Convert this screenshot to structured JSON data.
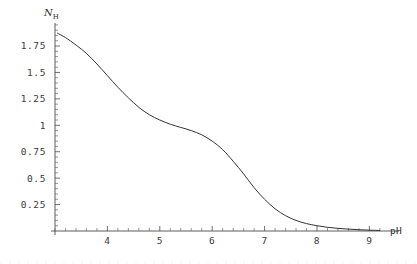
{
  "figure": {
    "kind": "mathematica-plot",
    "background_color": "#ffffff",
    "curve_color": "#333333",
    "axis_color": "#4a4a4a"
  },
  "labels": {
    "y_axis_symbol": "N",
    "y_axis_subscript": "H",
    "x_axis_title": "pH"
  },
  "chart_data": {
    "type": "line",
    "title": "",
    "subtitle": "",
    "xlabel": "pH",
    "ylabel": "N_H",
    "grid": false,
    "legend": null,
    "xlim": [
      3.0,
      9.3
    ],
    "ylim": [
      0.0,
      1.95
    ],
    "x_ticks_major": [
      4,
      5,
      6,
      7,
      8,
      9
    ],
    "x_tick_labels": [
      "4",
      "5",
      "6",
      "7",
      "8",
      "9"
    ],
    "x_minor_per_interval": 4,
    "y_ticks_major": [
      0.25,
      0.5,
      0.75,
      1,
      1.25,
      1.5,
      1.75
    ],
    "y_tick_labels": [
      "0.25",
      "0.5",
      "0.75",
      "1",
      "1.25",
      "1.5",
      "1.75"
    ],
    "y_minor_per_interval": 4,
    "series": [
      {
        "name": "N_H",
        "x": [
          3.05,
          3.2,
          3.4,
          3.6,
          3.8,
          4.0,
          4.2,
          4.4,
          4.6,
          4.8,
          5.0,
          5.2,
          5.4,
          5.6,
          5.8,
          6.0,
          6.2,
          6.4,
          6.6,
          6.8,
          7.0,
          7.2,
          7.4,
          7.6,
          7.8,
          8.0,
          8.2,
          8.4,
          8.6,
          8.8,
          9.0,
          9.2
        ],
        "y": [
          1.87,
          1.83,
          1.76,
          1.68,
          1.58,
          1.47,
          1.36,
          1.26,
          1.17,
          1.1,
          1.05,
          1.01,
          0.98,
          0.95,
          0.91,
          0.85,
          0.77,
          0.66,
          0.54,
          0.41,
          0.3,
          0.21,
          0.145,
          0.1,
          0.07,
          0.05,
          0.035,
          0.025,
          0.018,
          0.012,
          0.008,
          0.005
        ]
      }
    ]
  }
}
